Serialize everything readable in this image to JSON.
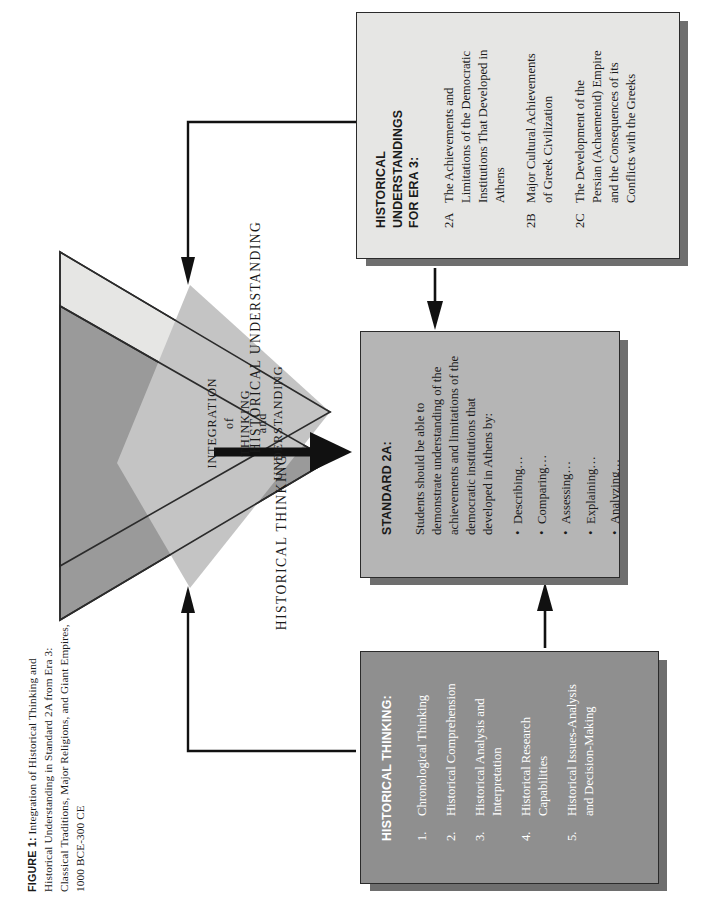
{
  "figure": {
    "label": "FIGURE 1:",
    "caption": " Integration of Historical Thinking and Historical Understanding in Standard 2A from Era 3: Classical Traditions, Major Religions, and Giant Empires, 1000 BCE-300 CE"
  },
  "diagram": {
    "triangle_understanding_label": "HISTORICAL UNDERSTANDING",
    "triangle_thinking_label": "HISTORICAL THINKING",
    "overlap_label_lines": [
      "INTEGRATION",
      "of",
      "THINKING",
      "and",
      "UNDERSTANDING"
    ],
    "colors": {
      "light_triangle": "#e6e6e4",
      "dark_triangle": "#9a9a9a",
      "overlap_diamond": "#c4c4c4",
      "outline": "#2b2b2b",
      "arrow": "#111111",
      "box_light": "#e6e6e4",
      "box_mid": "#b5b5b5",
      "box_dark": "#8f8f8f",
      "box_shadow": "#6e6e6e"
    }
  },
  "understandings_box": {
    "title_line1": "HISTORICAL UNDERSTANDINGS",
    "title_line2": "FOR ERA 3:",
    "items": [
      {
        "num": "2A",
        "text": "The Achievements and Limitations of the Democratic Institutions That Developed in Athens"
      },
      {
        "num": "2B",
        "text": "Major Cultural Achievements of Greek Civilization"
      },
      {
        "num": "2C",
        "text": "The Development of the Persian (Achaemenid) Empire and the Consequences of its Conflicts with the Greeks"
      }
    ]
  },
  "standard_box": {
    "title": "STANDARD 2A:",
    "body": "Students should be able to demonstrate understanding of the achievements and limitations of the democratic institutions that developed in Athens by:",
    "bullets": [
      "Describing…",
      "Comparing…",
      "Assessing…",
      "Explaining…",
      "Analyzing…"
    ]
  },
  "thinking_box": {
    "title": "HISTORICAL THINKING:",
    "items": [
      {
        "num": "1.",
        "text": "Chronological Thinking"
      },
      {
        "num": "2.",
        "text": "Historical Comprehension"
      },
      {
        "num": "3.",
        "text": "Historical Analysis and Interpretation"
      },
      {
        "num": "4.",
        "text": "Historical Research Capabilities"
      },
      {
        "num": "5.",
        "text": "Historical  Issues-Analysis and Decision-Making"
      }
    ]
  }
}
